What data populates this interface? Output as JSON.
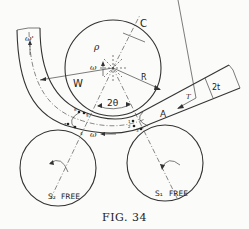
{
  "figure": {
    "caption": "FIG. 34",
    "labels": {
      "center": "C",
      "radius_rho": "ρ",
      "radius_R": "R",
      "omega_roller": "ω",
      "omega_prime": "ω'",
      "omega_pipe": "ω",
      "roller_W": "W",
      "angle": "2θ",
      "section_A": "A",
      "thickness": "2t",
      "tension": "T",
      "roller_S2": "S₂",
      "roller_S1": "S₁",
      "free_left": "FREE",
      "free_right": "FREE",
      "points": [
        "1",
        "2",
        "3",
        "4",
        "5",
        "6",
        "7"
      ]
    }
  }
}
